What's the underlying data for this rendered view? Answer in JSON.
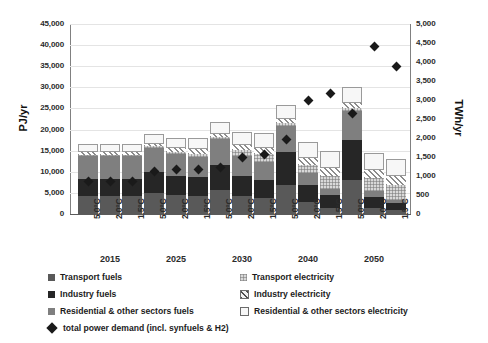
{
  "chart_data": {
    "type": "bar",
    "stacked": true,
    "title": "",
    "xlabel": "",
    "ylabel": "PJ/yr",
    "ylabel_secondary": "TWh/yr",
    "ylim": [
      0,
      45000
    ],
    "ylim_secondary": [
      0,
      5000
    ],
    "grid": true,
    "yticks": [
      "0",
      "5,000",
      "10,000",
      "15,000",
      "20,000",
      "25,000",
      "30,000",
      "35,000",
      "40,000",
      "45,000"
    ],
    "yticks_secondary": [
      "0",
      "500",
      "1,000",
      "1,500",
      "2,000",
      "2,500",
      "3,000",
      "3,500",
      "4,000",
      "4,500",
      "5,000"
    ],
    "group_labels": [
      "2015",
      "2025",
      "2030",
      "2040",
      "2050"
    ],
    "categories": [
      "5.0°C",
      "2.0°C",
      "1.5°C",
      "5.0°C",
      "2.0°C",
      "1.5°C",
      "5.0°C",
      "2.0°C",
      "1.5°C",
      "5.0°C",
      "2.0°C",
      "1.5°C",
      "5.0°C",
      "2.0°C",
      "1.5°C"
    ],
    "scenario_labels": [
      "5.0°C",
      "2.0°C",
      "1.5°C"
    ],
    "series": [
      {
        "name": "Transport fuels",
        "key": "tf",
        "color": "#595959",
        "values": [
          4200,
          4200,
          4200,
          5000,
          4400,
          4200,
          5700,
          4300,
          3900,
          6800,
          2900,
          1500,
          8000,
          1500,
          900
        ]
      },
      {
        "name": "Industry fuels",
        "key": "if",
        "color": "#262626",
        "values": [
          4200,
          4200,
          4200,
          5000,
          4700,
          4500,
          6000,
          4700,
          4200,
          7800,
          3900,
          2900,
          9600,
          2600,
          1800
        ]
      },
      {
        "name": "Residential & other sectors fuels",
        "key": "rf",
        "color": "#7f7f7f",
        "values": [
          5300,
          5300,
          5300,
          5600,
          5000,
          4800,
          6000,
          4800,
          4300,
          6300,
          2800,
          1600,
          6700,
          1300,
          700
        ]
      },
      {
        "name": "Transport electricity",
        "key": "te",
        "color": "#d9d9d9",
        "values": [
          300,
          300,
          300,
          400,
          600,
          800,
          500,
          1300,
          1800,
          700,
          2000,
          3000,
          900,
          3100,
          3400
        ]
      },
      {
        "name": "Industry electricity",
        "key": "ie",
        "color": "#f2f2f2",
        "values": [
          600,
          600,
          600,
          700,
          900,
          1000,
          800,
          1200,
          1500,
          1000,
          1600,
          2000,
          1200,
          1900,
          2100
        ]
      },
      {
        "name": "Residential & other sectors electricity",
        "key": "re",
        "color": "#f7f7f7",
        "values": [
          2100,
          2100,
          2100,
          2300,
          2500,
          2700,
          2800,
          3200,
          3400,
          3200,
          3800,
          4000,
          3600,
          4100,
          4200
        ]
      }
    ],
    "marker_series": {
      "name": "total power demand (incl. synfuels & H2)",
      "axis": "secondary",
      "unit": "TWh/yr",
      "values": [
        850,
        850,
        850,
        1130,
        1160,
        1180,
        1230,
        1500,
        1570,
        1950,
        2980,
        3160,
        2640,
        4420,
        3880
      ]
    }
  },
  "legend": {
    "position": "bottom",
    "entries": [
      {
        "label": "Transport fuels",
        "swatch": "transport-fuels-swatch"
      },
      {
        "label": "Transport electricity",
        "swatch": "transport-electricity-swatch"
      },
      {
        "label": "Industry fuels",
        "swatch": "industry-fuels-swatch"
      },
      {
        "label": "Industry electricity",
        "swatch": "industry-electricity-swatch"
      },
      {
        "label": "Residential & other sectors fuels",
        "swatch": "residential-fuels-swatch"
      },
      {
        "label": "Residential & other sectors electricity",
        "swatch": "residential-electricity-swatch"
      },
      {
        "label": "total power demand (incl. synfuels & H2)",
        "swatch": "total-power-demand-marker"
      }
    ]
  }
}
